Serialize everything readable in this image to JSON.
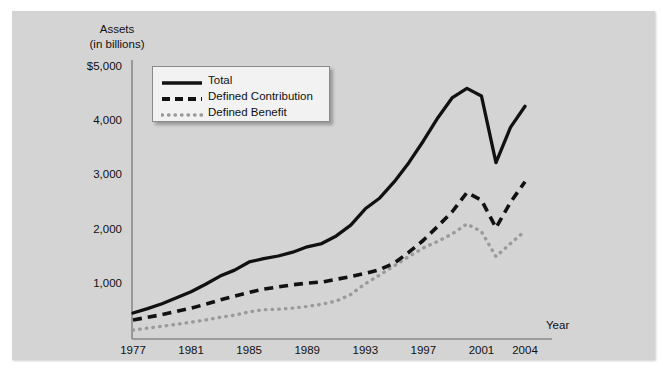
{
  "chart_data": {
    "type": "line",
    "title": "",
    "ylabel_line1": "Assets",
    "ylabel_line2": "(in billions)",
    "xlabel": "Year",
    "grid": false,
    "legend_position": "top-left",
    "xlim": [
      1977,
      2004
    ],
    "ylim": [
      0,
      5000
    ],
    "ytick_labels": [
      "$5,000",
      "4,000",
      "3,000",
      "2,000",
      "1,000"
    ],
    "ytick_values": [
      5000,
      4000,
      3000,
      2000,
      1000
    ],
    "xtick_labels": [
      "1977",
      "1981",
      "1985",
      "1989",
      "1993",
      "1997",
      "2001",
      "2004"
    ],
    "xtick_values": [
      1977,
      1981,
      1985,
      1989,
      1993,
      1997,
      2001,
      2004
    ],
    "x": [
      1977,
      1978,
      1979,
      1980,
      1981,
      1982,
      1983,
      1984,
      1985,
      1986,
      1987,
      1988,
      1989,
      1990,
      1991,
      1992,
      1993,
      1994,
      1995,
      1996,
      1997,
      1998,
      1999,
      2000,
      2001,
      2002,
      2003,
      2004
    ],
    "series": [
      {
        "name": "Total",
        "style": "solid",
        "color": "#111111",
        "values": [
          480,
          560,
          650,
          760,
          870,
          1010,
          1160,
          1270,
          1420,
          1480,
          1530,
          1600,
          1700,
          1760,
          1900,
          2100,
          2400,
          2600,
          2900,
          3250,
          3650,
          4080,
          4450,
          4620,
          4480,
          3250,
          3900,
          4290
        ]
      },
      {
        "name": "Defined Contribution",
        "style": "dashed",
        "color": "#111111",
        "values": [
          350,
          400,
          450,
          510,
          570,
          640,
          720,
          790,
          860,
          920,
          960,
          1000,
          1030,
          1050,
          1100,
          1150,
          1210,
          1280,
          1400,
          1600,
          1820,
          2080,
          2350,
          2700,
          2560,
          2050,
          2520,
          2900
        ]
      },
      {
        "name": "Defined Benefit",
        "style": "dotted",
        "color": "#9a9a9a",
        "values": [
          165,
          200,
          235,
          270,
          310,
          350,
          400,
          440,
          500,
          540,
          550,
          570,
          600,
          640,
          700,
          820,
          1020,
          1180,
          1350,
          1520,
          1680,
          1800,
          1940,
          2120,
          1980,
          1520,
          1760,
          1990
        ]
      }
    ]
  },
  "legend": {
    "items": [
      {
        "label": "Total",
        "style": "solid",
        "color": "#111111"
      },
      {
        "label": "Defined Contribution",
        "style": "dashed",
        "color": "#111111"
      },
      {
        "label": "Defined Benefit",
        "style": "dotted",
        "color": "#9a9a9a"
      }
    ]
  },
  "colors": {
    "panel_background": "#d4d4d4",
    "page_background": "#ffffff",
    "axis": "#8a8a8a",
    "text": "#111111",
    "total": "#111111",
    "defined_contribution": "#111111",
    "defined_benefit": "#9a9a9a"
  }
}
